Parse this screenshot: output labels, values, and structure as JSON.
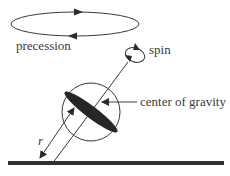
{
  "diagram": {
    "labels": {
      "precession": "precession",
      "spin": "spin",
      "center_of_gravity": "center of gravity",
      "radius": "r"
    },
    "colors": {
      "stroke": "#3a3a3a",
      "fill_dark": "#262626",
      "ground": "#2e2e2e",
      "background": "#ffffff"
    },
    "icons": [
      "precession-arrow-icon",
      "spin-arrow-icon",
      "pointer-arrow-icon"
    ]
  }
}
